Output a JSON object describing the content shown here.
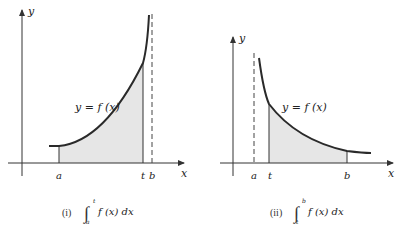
{
  "figures": [
    {
      "id": "i",
      "caption_label": "(i)",
      "integral": {
        "sign": "∫",
        "lower": "a",
        "upper": "t",
        "integrand": "f (x) dx"
      },
      "curve_label": "y = f (x)",
      "axis_labels": {
        "x": "x",
        "y": "y"
      },
      "tick_labels": [
        "a",
        "t",
        "b"
      ],
      "asymptote": "b",
      "shaded_region": "from a to t"
    },
    {
      "id": "ii",
      "caption_label": "(ii)",
      "integral": {
        "sign": "∫",
        "lower": "t",
        "upper": "b",
        "integrand": "f (x) dx"
      },
      "curve_label": "y = f (x)",
      "axis_labels": {
        "x": "x",
        "y": "y"
      },
      "tick_labels": [
        "a",
        "t",
        "b"
      ],
      "asymptote": "a",
      "shaded_region": "from t to b"
    }
  ],
  "colors": {
    "curve": "#2a2a2a",
    "axis": "#333333",
    "shade": "#e6e6e6",
    "dashed": "#444444"
  }
}
